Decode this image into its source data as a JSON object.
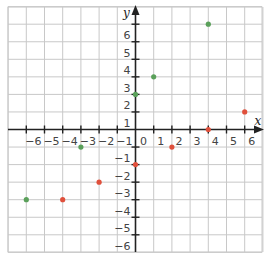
{
  "chart_data": {
    "type": "scatter",
    "title": "",
    "xlabel": "x",
    "ylabel": "y",
    "xlim": [
      -7,
      7
    ],
    "ylim": [
      -7,
      7
    ],
    "grid": true,
    "x_ticks": [
      -6,
      -5,
      -4,
      -3,
      -2,
      -1,
      1,
      2,
      3,
      4,
      5,
      6
    ],
    "y_ticks": [
      -6,
      -5,
      -4,
      -3,
      -2,
      -1,
      1,
      2,
      3,
      4,
      5,
      6
    ],
    "origin_label": "0",
    "series": [
      {
        "name": "green points",
        "color": "#5aa05a",
        "points": [
          [
            4,
            6
          ],
          [
            1,
            3
          ],
          [
            0,
            2
          ],
          [
            -3,
            -1
          ],
          [
            -6,
            -4
          ]
        ]
      },
      {
        "name": "red points",
        "color": "#e0503c",
        "points": [
          [
            6,
            1
          ],
          [
            4,
            0
          ],
          [
            2,
            -1
          ],
          [
            0,
            -2
          ],
          [
            -2,
            -3
          ],
          [
            -4,
            -4
          ]
        ]
      }
    ]
  },
  "colors": {
    "grid": "#c8c8c8",
    "axis": "#222222",
    "label": "#444444"
  }
}
